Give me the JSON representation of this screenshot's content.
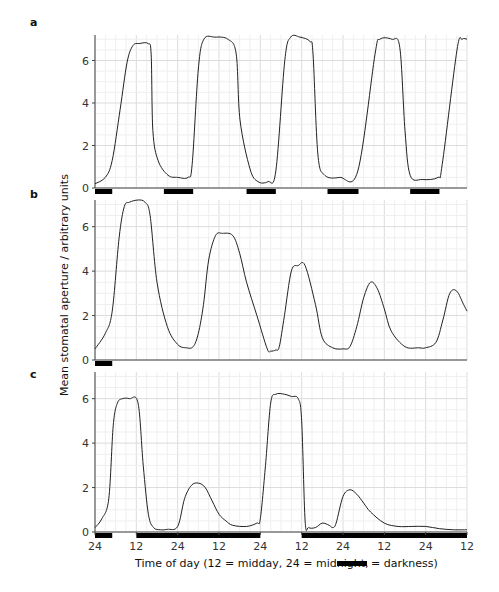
{
  "chart_data": {
    "type": "line",
    "ylabel": "Mean stomatal aperture / arbitrary units",
    "xlabel": "Time of day (12 = midday, 24 = midnight,",
    "xlabel_legend_suffix": "= darkness)",
    "x_unit": "hours from first midnight",
    "xlim": [
      0,
      108
    ],
    "x_ticks": [
      0,
      12,
      24,
      36,
      48,
      60,
      72,
      84,
      96,
      108
    ],
    "x_tick_labels": [
      "24",
      "12",
      "24",
      "12",
      "24",
      "12",
      "24",
      "12",
      "24",
      "12"
    ],
    "grid": true,
    "panels": [
      {
        "label": "a",
        "ylim": [
          0,
          7.2
        ],
        "y_ticks": [
          0,
          2,
          4,
          6
        ],
        "y_tick_labels": [
          "0",
          "2",
          "4",
          "6"
        ],
        "darkness": [
          [
            0,
            5
          ],
          [
            20,
            28.5
          ],
          [
            44,
            52.5
          ],
          [
            67.5,
            76.5
          ],
          [
            91.5,
            100
          ]
        ],
        "x": [
          0,
          3,
          5,
          7.3,
          9.3,
          11,
          13,
          15.4,
          16.3,
          16.8,
          18.3,
          21.2,
          24,
          27,
          28.2,
          30,
          31.6,
          34.8,
          38.6,
          41,
          42.1,
          45,
          47.3,
          50.2,
          52.5,
          55.1,
          56.8,
          59.5,
          62.4,
          63.3,
          64.7,
          66.7,
          71.1,
          76.3,
          81.3,
          82.7,
          86.2,
          88.5,
          90,
          91.5,
          95,
          99.6,
          100.8,
          105.1,
          106.6,
          108
        ],
        "values": [
          0.2,
          0.5,
          1.3,
          3.7,
          5.9,
          6.7,
          6.8,
          6.8,
          6.3,
          2.7,
          1.3,
          0.6,
          0.5,
          0.5,
          1.1,
          5.6,
          7.0,
          7.1,
          7.0,
          6.3,
          3.2,
          0.9,
          0.3,
          0.3,
          0.8,
          6.0,
          7.1,
          7.1,
          6.9,
          6.3,
          1.6,
          0.6,
          0.5,
          0.8,
          6.3,
          7.0,
          7.0,
          6.6,
          2.7,
          0.6,
          0.4,
          0.5,
          1.1,
          6.5,
          7.0,
          7.0
        ]
      },
      {
        "label": "b",
        "ylim": [
          0,
          7.2
        ],
        "y_ticks": [
          0,
          2,
          4,
          6
        ],
        "y_tick_labels": [
          "0",
          "2",
          "4",
          "6"
        ],
        "darkness": [
          [
            0,
            5
          ]
        ],
        "x": [
          0,
          3,
          5,
          7,
          8.5,
          10,
          12.5,
          14.5,
          16,
          18,
          21,
          24,
          26.5,
          28.5,
          30,
          31.5,
          33,
          35,
          37,
          40,
          42,
          44,
          47,
          50,
          51,
          52.5,
          53.5,
          55,
          57,
          59,
          61,
          64,
          66,
          69,
          72,
          74,
          76,
          78,
          80,
          82,
          84,
          86,
          90,
          94,
          96,
          99,
          101,
          103,
          105,
          107,
          108
        ],
        "values": [
          0.5,
          1.2,
          2.2,
          5.5,
          6.9,
          7.1,
          7.2,
          7.1,
          6.5,
          3.5,
          1.5,
          0.7,
          0.55,
          0.6,
          1.2,
          2.5,
          4.5,
          5.6,
          5.7,
          5.6,
          4.8,
          3.5,
          2.0,
          0.5,
          0.4,
          0.45,
          0.6,
          2.0,
          4.0,
          4.25,
          4.25,
          2.5,
          1.0,
          0.55,
          0.5,
          0.6,
          1.5,
          2.8,
          3.5,
          3.2,
          2.3,
          1.3,
          0.6,
          0.55,
          0.55,
          0.8,
          1.8,
          3.0,
          3.1,
          2.5,
          2.2
        ]
      },
      {
        "label": "c",
        "ylim": [
          0,
          7.2
        ],
        "y_ticks": [
          0,
          2,
          4,
          6
        ],
        "y_tick_labels": [
          "0",
          "2",
          "4",
          "6"
        ],
        "darkness": [
          [
            0,
            5
          ],
          [
            12,
            48
          ],
          [
            60,
            108
          ]
        ],
        "x": [
          0,
          2,
          4,
          5.3,
          6.5,
          8,
          10,
          12.5,
          14,
          15.5,
          17,
          19,
          21,
          24,
          26,
          28,
          30,
          32,
          34,
          36,
          38,
          40,
          44,
          47,
          48,
          49.5,
          51,
          52.5,
          55,
          57,
          59,
          60,
          61,
          62,
          64,
          66,
          68,
          69,
          70,
          72,
          74,
          76,
          78,
          80,
          84,
          88,
          92,
          96,
          100,
          104,
          108
        ],
        "values": [
          0.2,
          0.6,
          1.5,
          4.8,
          5.8,
          6.0,
          6.0,
          5.8,
          3.0,
          0.8,
          0.2,
          0.1,
          0.12,
          0.25,
          1.5,
          2.1,
          2.2,
          2.0,
          1.4,
          0.8,
          0.5,
          0.3,
          0.25,
          0.4,
          0.6,
          3.0,
          5.8,
          6.2,
          6.2,
          6.1,
          6.0,
          5.0,
          0.5,
          0.2,
          0.2,
          0.4,
          0.3,
          0.2,
          0.4,
          1.6,
          1.9,
          1.7,
          1.3,
          0.9,
          0.4,
          0.25,
          0.25,
          0.25,
          0.15,
          0.1,
          0.1
        ]
      }
    ]
  }
}
